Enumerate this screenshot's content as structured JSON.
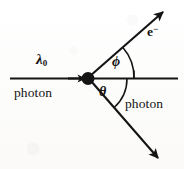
{
  "figure": {
    "width": 184,
    "height": 169,
    "background_color": "#fdfdfc",
    "ink_color": "#141414"
  },
  "labels": {
    "incident_wavelength": "λ",
    "incident_wavelength_subscript": "0",
    "incident_particle": "photon",
    "electron": "e",
    "electron_charge_superscript": "−",
    "electron_angle": "ϕ",
    "photon_angle": "θ",
    "scattered_particle": "photon"
  },
  "geometry": {
    "vertex": {
      "x": 88,
      "y": 78
    },
    "axis": {
      "x1": 10,
      "y1": 78,
      "x2": 178,
      "y2": 78
    },
    "incident_arrow_tip": {
      "x": 84,
      "y": 78
    },
    "electron_ray": {
      "x1": 90,
      "y1": 76,
      "x2": 163,
      "y2": 12,
      "angle_deg": 41
    },
    "scattered_photon_ray": {
      "x1": 91,
      "y1": 81,
      "x2": 158,
      "y2": 158,
      "angle_deg": -49
    },
    "phi_arc_radius": 46,
    "theta_arc_radius": 39,
    "vertex_dot_radius": 6.5
  }
}
